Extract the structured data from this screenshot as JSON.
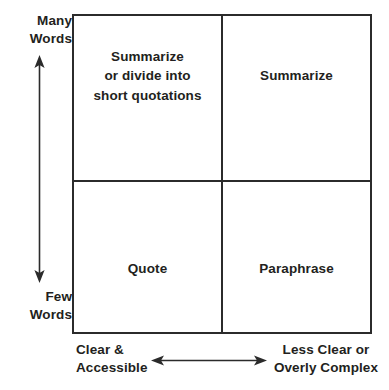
{
  "diagram": {
    "type": "2x2-matrix",
    "title_present": false,
    "axes": {
      "y": {
        "top_label": "Many\nWords",
        "bottom_label": "Few\nWords",
        "arrow": "double-headed-vertical"
      },
      "x": {
        "left_label": "Clear &\nAccessible",
        "right_label": "Less Clear or\nOverly Complex",
        "arrow": "double-headed-horizontal"
      }
    },
    "quadrants": [
      {
        "position": "top-left",
        "label": "Summarize\nor divide into\nshort quotations"
      },
      {
        "position": "top-right",
        "label": "Summarize"
      },
      {
        "position": "bottom-left",
        "label": "Quote"
      },
      {
        "position": "bottom-right",
        "label": "Paraphrase"
      }
    ],
    "colors": {
      "border": "#2b2b2b",
      "text": "#231f20",
      "background": "#ffffff",
      "arrow": "#2b2b2b"
    }
  }
}
